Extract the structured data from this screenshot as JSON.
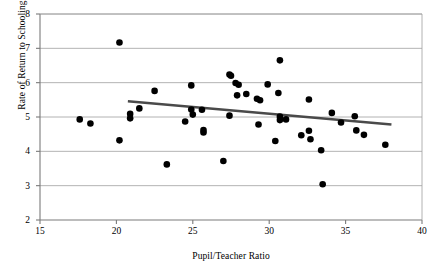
{
  "chart_data": {
    "type": "scatter",
    "title": "",
    "xlabel": "Pupil/Teacher Ratio",
    "ylabel": "Rate of Return to Schooling",
    "xlim": [
      15,
      40
    ],
    "ylim": [
      2,
      8
    ],
    "xticks": [
      15,
      20,
      25,
      30,
      35,
      40
    ],
    "yticks": [
      2,
      3,
      4,
      5,
      6,
      7,
      8
    ],
    "grid": "horizontal",
    "legend": "none",
    "marker_color": "#000000",
    "gridline_color": "#a0a0a0",
    "axis_color": "#7a7a7a",
    "trendline": {
      "label": "linear fit",
      "color": "#4a4a4a",
      "x_start": 20.75,
      "y_start": 5.46,
      "x_end": 38.0,
      "y_end": 4.78
    },
    "points": [
      {
        "x": 17.6,
        "y": 4.93
      },
      {
        "x": 18.3,
        "y": 4.81
      },
      {
        "x": 20.2,
        "y": 7.17
      },
      {
        "x": 20.2,
        "y": 4.32
      },
      {
        "x": 20.9,
        "y": 5.09
      },
      {
        "x": 20.9,
        "y": 4.96
      },
      {
        "x": 21.5,
        "y": 5.25
      },
      {
        "x": 22.5,
        "y": 5.76
      },
      {
        "x": 23.3,
        "y": 3.62
      },
      {
        "x": 24.5,
        "y": 4.87
      },
      {
        "x": 24.9,
        "y": 5.92
      },
      {
        "x": 24.9,
        "y": 5.22
      },
      {
        "x": 25.0,
        "y": 5.07
      },
      {
        "x": 25.6,
        "y": 5.21
      },
      {
        "x": 25.7,
        "y": 4.62
      },
      {
        "x": 25.7,
        "y": 4.55
      },
      {
        "x": 27.0,
        "y": 3.72
      },
      {
        "x": 27.4,
        "y": 6.24
      },
      {
        "x": 27.5,
        "y": 6.2
      },
      {
        "x": 27.4,
        "y": 5.04
      },
      {
        "x": 27.8,
        "y": 5.99
      },
      {
        "x": 28.0,
        "y": 5.94
      },
      {
        "x": 27.9,
        "y": 5.63
      },
      {
        "x": 28.5,
        "y": 5.67
      },
      {
        "x": 29.2,
        "y": 5.53
      },
      {
        "x": 29.4,
        "y": 5.49
      },
      {
        "x": 29.3,
        "y": 4.78
      },
      {
        "x": 29.9,
        "y": 5.95
      },
      {
        "x": 30.4,
        "y": 4.3
      },
      {
        "x": 30.7,
        "y": 6.65
      },
      {
        "x": 30.6,
        "y": 5.7
      },
      {
        "x": 30.7,
        "y": 5.01
      },
      {
        "x": 30.7,
        "y": 4.91
      },
      {
        "x": 31.1,
        "y": 4.93
      },
      {
        "x": 32.1,
        "y": 4.47
      },
      {
        "x": 32.6,
        "y": 5.51
      },
      {
        "x": 32.6,
        "y": 4.6
      },
      {
        "x": 32.7,
        "y": 4.35
      },
      {
        "x": 33.4,
        "y": 4.03
      },
      {
        "x": 33.5,
        "y": 3.04
      },
      {
        "x": 34.1,
        "y": 5.12
      },
      {
        "x": 34.7,
        "y": 4.84
      },
      {
        "x": 35.6,
        "y": 5.02
      },
      {
        "x": 35.7,
        "y": 4.61
      },
      {
        "x": 36.2,
        "y": 4.48
      },
      {
        "x": 37.6,
        "y": 4.19
      }
    ]
  }
}
